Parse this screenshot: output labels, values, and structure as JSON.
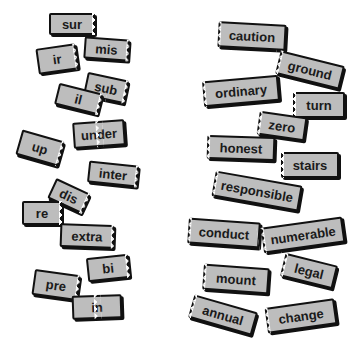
{
  "prefixes": [
    {
      "label": "sur",
      "x": 49,
      "y": 13,
      "w": 46,
      "h": 22,
      "rot": 0,
      "jag": "r"
    },
    {
      "label": "mis",
      "x": 84,
      "y": 38,
      "w": 45,
      "h": 22,
      "rot": 4,
      "jag": "r"
    },
    {
      "label": "ir",
      "x": 37,
      "y": 46,
      "w": 40,
      "h": 26,
      "rot": -8,
      "jag": "r"
    },
    {
      "label": "sub",
      "x": 85,
      "y": 76,
      "w": 42,
      "h": 24,
      "rot": 12,
      "jag": "r"
    },
    {
      "label": "il",
      "x": 56,
      "y": 88,
      "w": 45,
      "h": 22,
      "rot": 14,
      "jag": "r"
    },
    {
      "label": "under",
      "x": 73,
      "y": 121,
      "w": 52,
      "h": 26,
      "rot": -4,
      "jag": "n"
    },
    {
      "label": "up",
      "x": 18,
      "y": 135,
      "w": 44,
      "h": 26,
      "rot": 16,
      "jag": "r"
    },
    {
      "label": "inter",
      "x": 88,
      "y": 163,
      "w": 50,
      "h": 22,
      "rot": 6,
      "jag": "r"
    },
    {
      "label": "dis",
      "x": 50,
      "y": 185,
      "w": 38,
      "h": 22,
      "rot": 25,
      "jag": "r"
    },
    {
      "label": "re",
      "x": 22,
      "y": 201,
      "w": 40,
      "h": 24,
      "rot": 0,
      "jag": "r"
    },
    {
      "label": "extra",
      "x": 60,
      "y": 224,
      "w": 54,
      "h": 24,
      "rot": 2,
      "jag": "r"
    },
    {
      "label": "bi",
      "x": 87,
      "y": 256,
      "w": 42,
      "h": 24,
      "rot": -6,
      "jag": "r"
    },
    {
      "label": "pre",
      "x": 33,
      "y": 272,
      "w": 46,
      "h": 26,
      "rot": 8,
      "jag": "r"
    },
    {
      "label": "in",
      "x": 72,
      "y": 295,
      "w": 50,
      "h": 24,
      "rot": -2,
      "jag": "n"
    }
  ],
  "roots": [
    {
      "label": "caution",
      "x": 218,
      "y": 23,
      "w": 68,
      "h": 26,
      "rot": 3,
      "jag": "l"
    },
    {
      "label": "ground",
      "x": 277,
      "y": 58,
      "w": 66,
      "h": 24,
      "rot": 14,
      "jag": "l"
    },
    {
      "label": "ordinary",
      "x": 203,
      "y": 78,
      "w": 76,
      "h": 26,
      "rot": -5,
      "jag": "l"
    },
    {
      "label": "turn",
      "x": 293,
      "y": 92,
      "w": 52,
      "h": 26,
      "rot": 0,
      "jag": "l"
    },
    {
      "label": "zero",
      "x": 258,
      "y": 114,
      "w": 48,
      "h": 24,
      "rot": 8,
      "jag": "l"
    },
    {
      "label": "honest",
      "x": 207,
      "y": 136,
      "w": 68,
      "h": 24,
      "rot": 2,
      "jag": "l"
    },
    {
      "label": "stairs",
      "x": 281,
      "y": 152,
      "w": 58,
      "h": 26,
      "rot": 0,
      "jag": "l"
    },
    {
      "label": "responsible",
      "x": 213,
      "y": 178,
      "w": 88,
      "h": 26,
      "rot": 10,
      "jag": "l"
    },
    {
      "label": "conduct",
      "x": 188,
      "y": 220,
      "w": 72,
      "h": 26,
      "rot": 4,
      "jag": "l"
    },
    {
      "label": "numerable",
      "x": 262,
      "y": 222,
      "w": 82,
      "h": 26,
      "rot": -8,
      "jag": "l"
    },
    {
      "label": "legal",
      "x": 282,
      "y": 259,
      "w": 54,
      "h": 24,
      "rot": 14,
      "jag": "l"
    },
    {
      "label": "mount",
      "x": 203,
      "y": 266,
      "w": 66,
      "h": 26,
      "rot": 4,
      "jag": "l"
    },
    {
      "label": "annual",
      "x": 190,
      "y": 303,
      "w": 66,
      "h": 24,
      "rot": 16,
      "jag": "l"
    },
    {
      "label": "change",
      "x": 266,
      "y": 303,
      "w": 70,
      "h": 26,
      "rot": -8,
      "jag": "l"
    }
  ]
}
